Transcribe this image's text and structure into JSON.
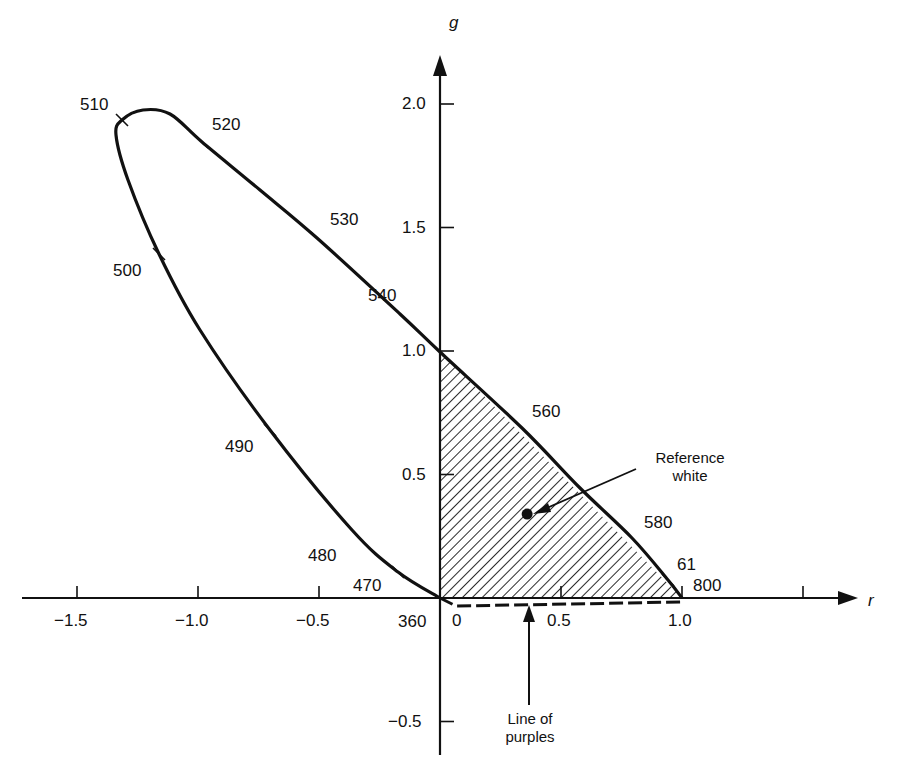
{
  "chart_data": {
    "type": "line",
    "title": "",
    "xlabel": "r",
    "ylabel": "g",
    "xlim": [
      -1.75,
      1.75
    ],
    "ylim": [
      -0.6,
      2.2
    ],
    "grid": false,
    "legend": null,
    "x_ticks": [
      -1.5,
      -1.0,
      -0.5,
      0,
      0.5,
      1.0,
      1.5
    ],
    "x_tick_labels": [
      "-1.5",
      "-1.0",
      "-0.5",
      "0",
      "0.5",
      "1.0",
      ""
    ],
    "y_ticks": [
      -0.5,
      0.5,
      1.0,
      1.5,
      2.0
    ],
    "y_tick_labels": [
      "-0.5",
      "0.5",
      "1.0",
      "1.5",
      "2.0"
    ],
    "series": [
      {
        "name": "Spectral locus (wavelength, nm)",
        "wavelengths": [
          360,
          470,
          480,
          490,
          500,
          510,
          520,
          530,
          540,
          560,
          580,
          610,
          800
        ],
        "r": [
          0.0,
          -0.17,
          -0.36,
          -0.7,
          -1.16,
          -1.31,
          -0.98,
          -0.51,
          -0.17,
          0.34,
          0.79,
          0.94,
          1.0
        ],
        "g": [
          0.0,
          0.11,
          0.28,
          0.68,
          1.39,
          1.94,
          1.85,
          1.46,
          1.15,
          0.69,
          0.24,
          0.07,
          0.0
        ]
      },
      {
        "name": "Line of purples",
        "style": "dashed",
        "r": [
          0.0,
          1.0
        ],
        "g": [
          0.0,
          0.0
        ]
      },
      {
        "name": "Shaded triangle (realizable with r,g,b primaries)",
        "style": "hatched",
        "r": [
          0.0,
          0.0,
          1.0
        ],
        "g": [
          0.0,
          1.0,
          0.0
        ]
      }
    ],
    "points": [
      {
        "name": "Reference white",
        "r": 0.36,
        "g": 0.34
      }
    ],
    "annotations": [
      {
        "text": "Reference white",
        "points_to": [
          0.36,
          0.34
        ]
      },
      {
        "text": "Line of purples",
        "points_to": [
          0.36,
          0.0
        ]
      }
    ],
    "wavelength_labels": [
      "510",
      "520",
      "530",
      "540",
      "560",
      "580",
      "61",
      "800",
      "500",
      "490",
      "480",
      "470",
      "360"
    ]
  },
  "labels": {
    "x_axis_name": "r",
    "y_axis_name": "g",
    "origin": "0",
    "ref_white_line1": "Reference",
    "ref_white_line2": "white",
    "purples_line1": "Line of",
    "purples_line2": "purples"
  }
}
